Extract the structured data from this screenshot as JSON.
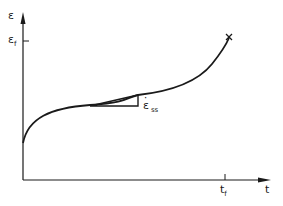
{
  "diagram": {
    "y_axis": {
      "symbol": "ε",
      "tick_label_main": "ε",
      "tick_label_sub": "f"
    },
    "x_axis": {
      "symbol": "t",
      "tick_label_main": "t",
      "tick_label_sub": "f"
    },
    "slope_label": {
      "main": "ε",
      "dot": "·",
      "sub": "ss"
    },
    "fracture_marker": "×",
    "colors": {
      "line": "#1a1a1a",
      "background": "#ffffff"
    }
  }
}
